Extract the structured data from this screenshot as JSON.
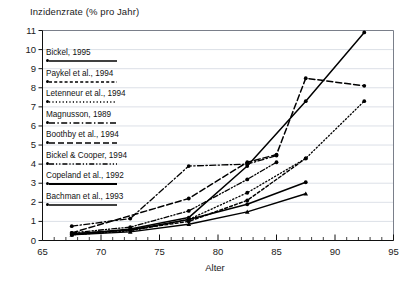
{
  "chart_data": {
    "type": "line",
    "title": "",
    "ylabel": "Inzidenzrate  (% pro Jahr)",
    "xlabel": "Alter",
    "xlim": [
      65,
      95
    ],
    "ylim": [
      0,
      11
    ],
    "xticks": [
      65,
      70,
      75,
      80,
      85,
      90,
      95
    ],
    "yticks": [
      0,
      1,
      2,
      3,
      4,
      5,
      6,
      7,
      8,
      9,
      10,
      11
    ],
    "xtick_minor_step": 1,
    "grid": "horizontal",
    "legend_position": "upper-left-inside",
    "series": [
      {
        "name": "Bickel, 1995",
        "style": "solid",
        "color": "#000000",
        "x": [
          67.5,
          72.5,
          77.5,
          82.5,
          87.5,
          92.5
        ],
        "y": [
          0.3,
          0.6,
          1.2,
          3.9,
          7.3,
          10.9
        ]
      },
      {
        "name": "Paykel et al., 1994",
        "style": "dotted",
        "color": "#000000",
        "x": [
          67.5,
          72.5,
          77.5,
          82.5,
          87.5
        ],
        "y": [
          0.35,
          0.55,
          1.0,
          2.1,
          4.3
        ]
      },
      {
        "name": "Letenneur et al., 1994",
        "style": "fine-dotted",
        "color": "#000000",
        "x": [
          67.5,
          72.5,
          77.5,
          82.5,
          87.5,
          92.5
        ],
        "y": [
          0.3,
          0.5,
          1.1,
          2.5,
          4.3,
          7.3
        ]
      },
      {
        "name": "Magnusson, 1989",
        "style": "dash-dot",
        "color": "#000000",
        "x": [
          67.5,
          72.5,
          77.5,
          82.5,
          85.0
        ],
        "y": [
          0.75,
          1.15,
          3.9,
          4.0,
          4.45
        ]
      },
      {
        "name": "Boothby et al., 1994",
        "style": "dashed",
        "color": "#000000",
        "x": [
          67.5,
          77.5,
          82.5,
          85.0,
          87.5,
          92.5
        ],
        "y": [
          0.4,
          2.2,
          4.1,
          4.5,
          8.5,
          8.1
        ]
      },
      {
        "name": "Bickel & Cooper, 1994",
        "style": "dash-dot-dot",
        "color": "#000000",
        "x": [
          67.5,
          72.5,
          77.5,
          82.5,
          85.0
        ],
        "y": [
          0.4,
          0.7,
          1.55,
          3.2,
          4.1
        ]
      },
      {
        "name": "Copeland et al., 1992",
        "style": "solid-thick",
        "color": "#000000",
        "x": [
          67.5,
          72.5,
          77.5,
          82.5,
          87.5
        ],
        "y": [
          0.35,
          0.55,
          1.1,
          1.9,
          3.05
        ]
      },
      {
        "name": "Bachman et al., 1993",
        "style": "solid-marker-tri",
        "color": "#000000",
        "x": [
          67.5,
          72.5,
          77.5,
          82.5,
          87.5
        ],
        "y": [
          0.3,
          0.45,
          0.85,
          1.5,
          2.45
        ]
      }
    ]
  },
  "legend": {
    "items": [
      {
        "label": "Bickel, 1995",
        "style": "solid"
      },
      {
        "label": "Paykel et al., 1994",
        "style": "dotted"
      },
      {
        "label": "Letenneur et al., 1994",
        "style": "fine-dotted"
      },
      {
        "label": "Magnusson, 1989",
        "style": "dash-dot"
      },
      {
        "label": "Boothby et al., 1994",
        "style": "dashed"
      },
      {
        "label": "Bickel & Cooper, 1994",
        "style": "dash-dot-dot"
      },
      {
        "label": "Copeland et al., 1992",
        "style": "solid-thick"
      },
      {
        "label": "Bachman et al., 1993",
        "style": "solid-marker-tri"
      }
    ]
  },
  "axes": {
    "y_title": "Inzidenzrate  (% pro Jahr)",
    "x_title": "Alter",
    "y_labels": [
      "11",
      "10",
      "9",
      "8",
      "7",
      "6",
      "5",
      "4",
      "3",
      "2",
      "1",
      "0"
    ],
    "x_labels": [
      "65",
      "70",
      "75",
      "80",
      "85",
      "90",
      "95"
    ]
  },
  "colors": {
    "line": "#000000",
    "grid": "#d8dce4",
    "frame": "#7a7f8a",
    "text": "#111111",
    "background": "#ffffff"
  }
}
